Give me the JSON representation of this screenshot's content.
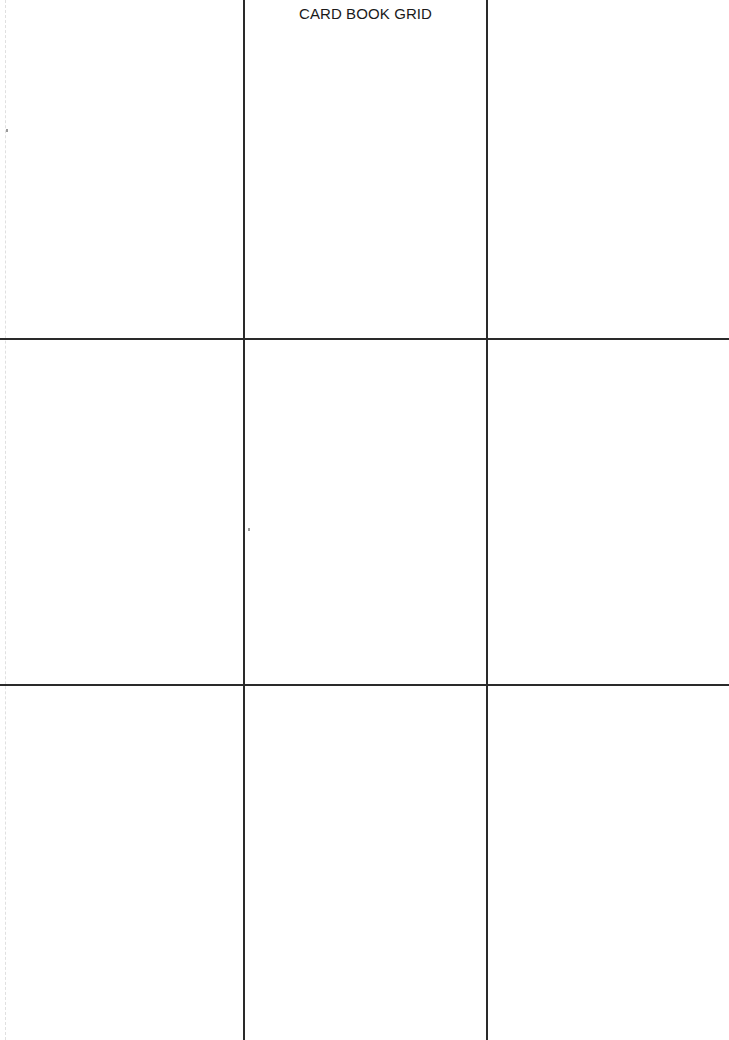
{
  "page": {
    "title": "CARD BOOK GRID",
    "background_color": "#ffffff",
    "line_color": "#2a2a2a"
  },
  "grid": {
    "rows": 3,
    "columns": 3,
    "vertical_lines_x": [
      244,
      487
    ],
    "horizontal_lines_y": [
      339,
      685
    ],
    "cells": [
      {
        "row": 1,
        "col": 1
      },
      {
        "row": 1,
        "col": 2
      },
      {
        "row": 1,
        "col": 3
      },
      {
        "row": 2,
        "col": 1
      },
      {
        "row": 2,
        "col": 2
      },
      {
        "row": 2,
        "col": 3
      },
      {
        "row": 3,
        "col": 1
      },
      {
        "row": 3,
        "col": 2
      },
      {
        "row": 3,
        "col": 3
      }
    ]
  }
}
